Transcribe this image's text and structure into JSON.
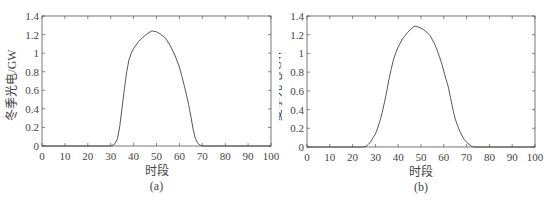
{
  "chart_data": [
    {
      "type": "line",
      "panel_label": "(a)",
      "title": "",
      "xlabel": "时段",
      "ylabel": "冬季光电/GW",
      "xlim": [
        0,
        100
      ],
      "ylim": [
        0,
        1.4
      ],
      "xticks": [
        0,
        10,
        20,
        30,
        40,
        50,
        60,
        70,
        80,
        90,
        100
      ],
      "yticks": [
        0,
        0.2,
        0.4,
        0.6,
        0.8,
        1,
        1.2,
        1.4
      ],
      "ytick_labels": [
        "0",
        "0.2",
        "0.4",
        "0.6",
        "0.8",
        "1",
        "1.2",
        "1.4"
      ],
      "grid": false,
      "legend": null,
      "series": [
        {
          "name": "冬季光电",
          "x": [
            0,
            30,
            31,
            32,
            33,
            34,
            35,
            36,
            37,
            38,
            39,
            40,
            42,
            44,
            46,
            48,
            50,
            52,
            54,
            56,
            58,
            60,
            61,
            62,
            63,
            64,
            65,
            66,
            67,
            68,
            69,
            70,
            100
          ],
          "y": [
            0,
            0,
            0.01,
            0.03,
            0.08,
            0.22,
            0.42,
            0.62,
            0.8,
            0.93,
            1.0,
            1.05,
            1.12,
            1.17,
            1.21,
            1.24,
            1.23,
            1.2,
            1.16,
            1.08,
            0.98,
            0.85,
            0.76,
            0.66,
            0.56,
            0.45,
            0.32,
            0.18,
            0.08,
            0.03,
            0.01,
            0,
            0
          ]
        }
      ]
    },
    {
      "type": "line",
      "panel_label": "(b)",
      "title": "",
      "xlabel": "时段",
      "ylabel": "夏季光电/GW",
      "xlim": [
        0,
        100
      ],
      "ylim": [
        0,
        1.4
      ],
      "xticks": [
        0,
        10,
        20,
        30,
        40,
        50,
        60,
        70,
        80,
        90,
        100
      ],
      "yticks": [
        0,
        0.2,
        0.4,
        0.6,
        0.8,
        1,
        1.2,
        1.4
      ],
      "ytick_labels": [
        "0",
        "0.2",
        "0.4",
        "0.6",
        "0.8",
        "1",
        "1.2",
        "1.4"
      ],
      "grid": false,
      "legend": null,
      "series": [
        {
          "name": "夏季光电",
          "x": [
            0,
            25,
            26,
            27,
            28,
            29,
            30,
            31,
            32,
            33,
            34,
            35,
            36,
            37,
            38,
            39,
            40,
            42,
            44,
            46,
            47,
            48,
            50,
            52,
            54,
            56,
            57,
            58,
            59,
            60,
            61,
            62,
            63,
            64,
            65,
            66,
            67,
            68,
            69,
            70,
            71,
            72,
            73,
            100
          ],
          "y": [
            0,
            0,
            0.01,
            0.03,
            0.06,
            0.1,
            0.14,
            0.2,
            0.28,
            0.37,
            0.48,
            0.6,
            0.73,
            0.84,
            0.94,
            1.01,
            1.07,
            1.16,
            1.22,
            1.27,
            1.29,
            1.29,
            1.27,
            1.24,
            1.19,
            1.1,
            1.04,
            0.97,
            0.9,
            0.81,
            0.72,
            0.64,
            0.52,
            0.4,
            0.3,
            0.23,
            0.17,
            0.12,
            0.08,
            0.05,
            0.03,
            0.01,
            0,
            0
          ]
        }
      ]
    }
  ],
  "colors": {
    "axis": "#555555",
    "line": "#444444",
    "text": "#444444"
  }
}
